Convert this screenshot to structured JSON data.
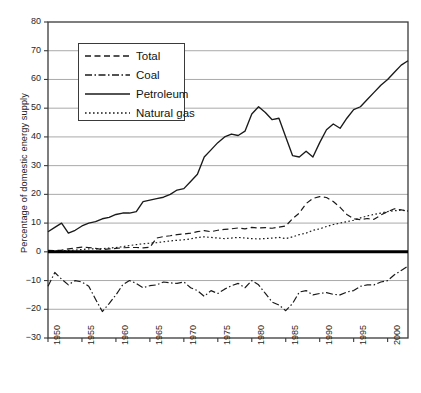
{
  "chart_data": {
    "type": "line",
    "title": "",
    "subtitle": "",
    "xlabel": "",
    "ylabel": "Percentage of domestic energy supply",
    "xlim": [
      1950,
      2003
    ],
    "ylim": [
      -30,
      80
    ],
    "yticks": [
      -30,
      -20,
      -10,
      0,
      10,
      20,
      30,
      40,
      50,
      60,
      70,
      80
    ],
    "xticks": [
      1950,
      1955,
      1960,
      1965,
      1970,
      1975,
      1980,
      1985,
      1990,
      1995,
      2000
    ],
    "grid": "horizontal",
    "zero_line_emphasis": true,
    "legend_position": "upper-left-inside",
    "x": [
      1950,
      1951,
      1952,
      1953,
      1954,
      1955,
      1956,
      1957,
      1958,
      1959,
      1960,
      1961,
      1962,
      1963,
      1964,
      1965,
      1966,
      1967,
      1968,
      1969,
      1970,
      1971,
      1972,
      1973,
      1974,
      1975,
      1976,
      1977,
      1978,
      1979,
      1980,
      1981,
      1982,
      1983,
      1984,
      1985,
      1986,
      1987,
      1988,
      1989,
      1990,
      1991,
      1992,
      1993,
      1994,
      1995,
      1996,
      1997,
      1998,
      1999,
      2000,
      2001,
      2002,
      2003
    ],
    "series": [
      {
        "name": "Total",
        "style": "dashed",
        "color": "#1a1a1a",
        "values": [
          0.5,
          0.4,
          0.6,
          1.0,
          1.3,
          1.6,
          1.5,
          1.2,
          0.8,
          1.0,
          1.2,
          1.4,
          1.5,
          1.5,
          1.4,
          1.6,
          4.8,
          5.3,
          5.6,
          6.0,
          6.2,
          6.5,
          7.0,
          7.4,
          7.0,
          7.5,
          7.8,
          8.0,
          8.3,
          8.0,
          8.5,
          8.3,
          8.4,
          8.2,
          8.6,
          9.0,
          11.5,
          13.5,
          16.8,
          18.6,
          19.2,
          18.9,
          17.5,
          15.5,
          13.0,
          11.5,
          11.2,
          11.6,
          11.3,
          12.8,
          14.0,
          15.0,
          14.6,
          14.2
        ]
      },
      {
        "name": "Coal",
        "style": "dash-dot",
        "color": "#1a1a1a",
        "values": [
          -12.0,
          -7.2,
          -9.5,
          -11.5,
          -10.0,
          -10.5,
          -12.0,
          -16.5,
          -20.8,
          -18.0,
          -15.0,
          -11.5,
          -10.0,
          -11.0,
          -12.5,
          -11.8,
          -11.5,
          -10.5,
          -10.8,
          -11.0,
          -10.5,
          -12.5,
          -13.5,
          -15.5,
          -13.5,
          -14.5,
          -13.0,
          -11.8,
          -11.0,
          -12.5,
          -10.0,
          -11.5,
          -14.5,
          -17.5,
          -18.5,
          -20.5,
          -18.0,
          -14.0,
          -13.5,
          -15.0,
          -14.5,
          -14.2,
          -14.8,
          -15.0,
          -14.0,
          -13.5,
          -12.0,
          -11.5,
          -11.5,
          -10.5,
          -10.0,
          -8.0,
          -6.5,
          -5.0
        ]
      },
      {
        "name": "Petroleum",
        "style": "solid",
        "color": "#1a1a1a",
        "values": [
          7.0,
          8.5,
          10.0,
          6.5,
          7.5,
          9.0,
          10.0,
          10.5,
          11.5,
          12.0,
          13.0,
          13.5,
          13.5,
          14.0,
          17.5,
          18.0,
          18.5,
          19.0,
          20.0,
          21.5,
          22.0,
          24.5,
          27.0,
          33.0,
          35.5,
          38.0,
          40.0,
          41.0,
          40.5,
          42.0,
          48.0,
          50.5,
          48.5,
          46.0,
          46.5,
          40.0,
          33.5,
          33.0,
          35.0,
          33.0,
          38.0,
          42.5,
          44.5,
          43.0,
          46.5,
          49.5,
          50.5,
          53.0,
          55.5,
          58.0,
          60.0,
          62.5,
          65.0,
          66.5
        ]
      },
      {
        "name": "Natural gas",
        "style": "dotted",
        "color": "#1a1a1a",
        "values": [
          0.2,
          0.2,
          0.3,
          0.5,
          0.6,
          0.8,
          1.0,
          1.0,
          1.1,
          1.3,
          1.5,
          1.8,
          2.2,
          2.5,
          2.8,
          3.0,
          3.2,
          3.5,
          3.8,
          4.0,
          4.2,
          4.5,
          5.0,
          5.2,
          5.0,
          4.8,
          4.6,
          4.8,
          5.0,
          4.8,
          4.6,
          4.5,
          4.6,
          4.8,
          5.0,
          4.6,
          5.2,
          6.0,
          6.5,
          7.5,
          8.0,
          8.8,
          9.5,
          10.0,
          10.5,
          11.0,
          11.8,
          12.5,
          13.0,
          13.5,
          14.0,
          14.3,
          14.5,
          14.2
        ]
      }
    ]
  },
  "axes": {
    "ylabel": "Percentage of domestic energy supply",
    "ytick_labels": [
      "80",
      "70",
      "60",
      "50",
      "40",
      "30",
      "20",
      "10",
      "0",
      "−10",
      "−20",
      "−30"
    ],
    "xtick_labels": [
      "1950",
      "1955",
      "1960",
      "1965",
      "1970",
      "1975",
      "1980",
      "1985",
      "1990",
      "1995",
      "2000"
    ]
  },
  "legend": {
    "entries": [
      {
        "label": "Total",
        "style": "dashed"
      },
      {
        "label": "Coal",
        "style": "dash-dot"
      },
      {
        "label": "Petroleum",
        "style": "solid"
      },
      {
        "label": "Natural gas",
        "style": "dotted"
      }
    ]
  },
  "caption": {
    "text": ""
  },
  "colors": {
    "line": "#1a1a1a",
    "grid": "#aaaaaa",
    "axis": "#3a3a3a",
    "zero_line": "#000000",
    "background": "#ffffff"
  }
}
